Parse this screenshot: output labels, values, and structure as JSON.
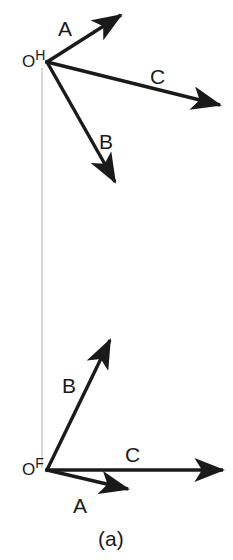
{
  "figure": {
    "caption": "(a)",
    "caption_x": 98,
    "caption_y": 528,
    "background_color": "#ffffff",
    "ink_color": "#1a1a1a",
    "projection_line_color": "#b9b9b9"
  },
  "views": [
    {
      "name": "horizontal-view",
      "origin_label_o": "O",
      "origin_label_sup": "H",
      "origin_x": 47,
      "origin_y": 62,
      "origin_label_x": 22,
      "origin_label_y": 49,
      "vectors": [
        {
          "id": "A",
          "label": "A",
          "label_x": 58,
          "label_y": 18,
          "tip_x": 126,
          "tip_y": 11
        },
        {
          "id": "C",
          "label": "C",
          "label_x": 150,
          "label_y": 66,
          "tip_x": 226,
          "tip_y": 108
        },
        {
          "id": "B",
          "label": "B",
          "label_x": 99,
          "label_y": 131,
          "tip_x": 119,
          "tip_y": 189
        }
      ]
    },
    {
      "name": "frontal-view",
      "origin_label_o": "O",
      "origin_label_sup": "F",
      "origin_x": 47,
      "origin_y": 470,
      "origin_label_x": 22,
      "origin_label_y": 457,
      "vectors": [
        {
          "id": "B",
          "label": "B",
          "label_x": 62,
          "label_y": 375,
          "tip_x": 114,
          "tip_y": 334
        },
        {
          "id": "C",
          "label": "C",
          "label_x": 125,
          "label_y": 444,
          "tip_x": 229,
          "tip_y": 470
        },
        {
          "id": "A",
          "label": "A",
          "label_x": 73,
          "label_y": 495,
          "tip_x": 134,
          "tip_y": 491
        }
      ]
    }
  ],
  "projection_line": {
    "x": 42,
    "y_top": 68,
    "y_bottom": 468
  }
}
